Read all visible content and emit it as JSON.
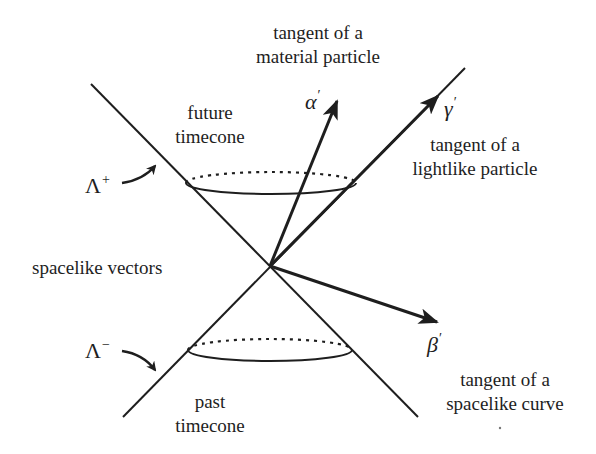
{
  "diagram": {
    "colors": {
      "background": "#ffffff",
      "ink": "#1e1e1e"
    },
    "labels": {
      "material_tangent": [
        "tangent of a",
        "material particle"
      ],
      "future_timecone": [
        "future",
        "timecone"
      ],
      "lightlike_tangent": [
        "tangent of a",
        "lightlike particle"
      ],
      "spacelike_vectors": "spacelike vectors",
      "past_timecone": [
        "past",
        "timecone"
      ],
      "spacelike_tangent": [
        "tangent of a",
        "spacelike curve"
      ]
    },
    "symbols": {
      "alpha": {
        "base": "α",
        "prime": "′"
      },
      "gamma": {
        "base": "γ",
        "prime": "′"
      },
      "beta": {
        "base": "β",
        "prime": "′"
      },
      "lambda_plus": {
        "base": "Λ",
        "sup": "+"
      },
      "lambda_minus": {
        "base": "Λ",
        "sup": "−"
      }
    },
    "geometry": {
      "apex": [
        270,
        266
      ],
      "cone_line_1": [
        [
          91,
          84
        ],
        [
          418,
          417
        ]
      ],
      "cone_line_2": [
        [
          123,
          417
        ],
        [
          465,
          68
        ]
      ],
      "future_ellipse": {
        "cx": 271,
        "cy": 183,
        "rx": 85,
        "ry": 11
      },
      "past_ellipse": {
        "cx": 270,
        "cy": 350,
        "rx": 82,
        "ry": 11
      },
      "vectors": [
        {
          "name": "alpha-prime",
          "tip": [
            337,
            101
          ],
          "kind": "timelike"
        },
        {
          "name": "gamma-prime",
          "tip": [
            438,
            96
          ],
          "kind": "lightlike"
        },
        {
          "name": "beta-prime",
          "tip": [
            437,
            322
          ],
          "kind": "spacelike"
        }
      ]
    }
  }
}
